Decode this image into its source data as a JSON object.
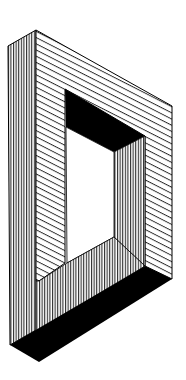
{
  "figure": {
    "colors": {
      "background": "#ffffff",
      "ink": "#000000"
    }
  }
}
